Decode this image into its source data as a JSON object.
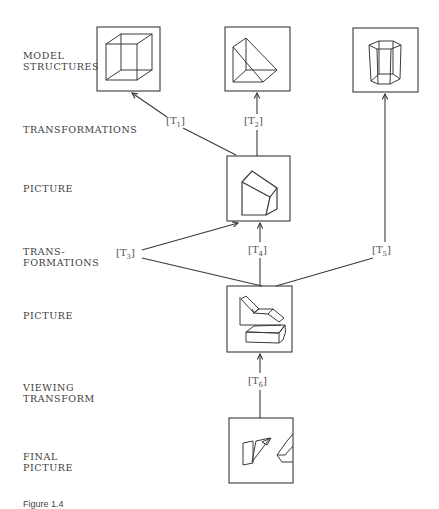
{
  "row_labels": {
    "model_structures": "MODEL\nSTRUCTURES",
    "transformations": "TRANSFORMATIONS",
    "picture_1": "PICTURE",
    "transformations_2": "TRANS-\nFORMATIONS",
    "picture_2": "PICTURE",
    "viewing_transform": "VIEWING\nTRANSFORM",
    "final_picture": "FINAL\nPICTURE"
  },
  "transforms": [
    {
      "id": "T1",
      "base": "T",
      "sub": "1"
    },
    {
      "id": "T2",
      "base": "T",
      "sub": "2"
    },
    {
      "id": "T3",
      "base": "T",
      "sub": "3"
    },
    {
      "id": "T4",
      "base": "T",
      "sub": "4"
    },
    {
      "id": "T5",
      "base": "T",
      "sub": "5"
    },
    {
      "id": "T6",
      "base": "T",
      "sub": "6"
    }
  ],
  "boxes": [
    {
      "id": "model-cube",
      "content": "wireframe cube"
    },
    {
      "id": "model-wedge",
      "content": "wireframe wedge"
    },
    {
      "id": "model-hex-prism",
      "content": "wireframe hexagonal prism"
    },
    {
      "id": "picture-block",
      "content": "beveled block"
    },
    {
      "id": "picture-composite",
      "content": "chair-like shape and bar"
    },
    {
      "id": "final-picture",
      "content": "clipped shapes"
    }
  ],
  "caption": "Figure 1.4",
  "colors": {
    "line": "#3a3a3a",
    "background": "#ffffff"
  }
}
